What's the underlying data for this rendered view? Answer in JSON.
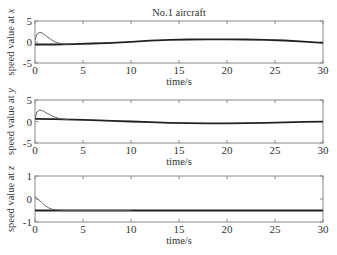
{
  "figure": {
    "title": "No.1 aircraft",
    "colors": {
      "axes": "#8a8a8a",
      "thick_line": "#222222",
      "thin_line": "#555555",
      "text": "#333333"
    }
  },
  "chart_data": [
    {
      "type": "line",
      "title": "No.1 aircraft",
      "xlabel": "time/s",
      "ylabel": "speed value at x",
      "ylabel_var": "x",
      "xlim": [
        0,
        30
      ],
      "ylim": [
        -5,
        5
      ],
      "xticks": [
        0,
        5,
        10,
        15,
        20,
        25,
        30
      ],
      "yticks": [
        -5,
        0,
        5
      ],
      "grid": false,
      "series": [
        {
          "name": "leader/target (thick)",
          "style": "thick",
          "x": [
            0,
            2,
            4,
            6,
            8,
            10,
            12,
            14,
            16,
            18,
            20,
            22,
            24,
            26,
            28,
            30
          ],
          "values": [
            -0.6,
            -0.6,
            -0.5,
            -0.35,
            -0.2,
            0.05,
            0.3,
            0.5,
            0.6,
            0.65,
            0.65,
            0.6,
            0.5,
            0.35,
            0.1,
            -0.2
          ]
        },
        {
          "name": "follower (thin)",
          "style": "thin",
          "x": [
            0,
            0.2,
            0.5,
            0.8,
            1.2,
            1.6,
            2,
            2.5,
            3,
            3.5
          ],
          "values": [
            0.5,
            1.8,
            2.3,
            2.1,
            1.4,
            0.7,
            0.1,
            -0.3,
            -0.5,
            -0.55
          ]
        }
      ]
    },
    {
      "type": "line",
      "xlabel": "time/s",
      "ylabel": "speed value at y",
      "ylabel_var": "y",
      "xlim": [
        0,
        30
      ],
      "ylim": [
        -5,
        5
      ],
      "xticks": [
        0,
        5,
        10,
        15,
        20,
        25,
        30
      ],
      "yticks": [
        -5,
        0,
        5
      ],
      "grid": false,
      "series": [
        {
          "name": "leader/target (thick)",
          "style": "thick",
          "x": [
            0,
            2,
            4,
            6,
            8,
            10,
            12,
            14,
            16,
            18,
            20,
            22,
            24,
            26,
            28,
            30
          ],
          "values": [
            0.6,
            0.55,
            0.45,
            0.3,
            0.15,
            0.0,
            -0.15,
            -0.3,
            -0.4,
            -0.45,
            -0.45,
            -0.4,
            -0.3,
            -0.2,
            -0.1,
            -0.05
          ]
        },
        {
          "name": "follower (thin)",
          "style": "thin",
          "x": [
            0,
            0.2,
            0.5,
            0.8,
            1.2,
            1.6,
            2,
            2.5,
            3,
            3.5
          ],
          "values": [
            0.6,
            2.2,
            2.7,
            2.5,
            2.0,
            1.5,
            1.1,
            0.7,
            0.5,
            0.45
          ]
        }
      ]
    },
    {
      "type": "line",
      "xlabel": "time/s",
      "ylabel": "speed value at z",
      "ylabel_var": "z",
      "xlim": [
        0,
        30
      ],
      "ylim": [
        -1,
        1
      ],
      "xticks": [
        0,
        5,
        10,
        15,
        20,
        25,
        30
      ],
      "yticks": [
        -1,
        0,
        1
      ],
      "grid": false,
      "series": [
        {
          "name": "leader/target (thick)",
          "style": "thick",
          "x": [
            0,
            30
          ],
          "values": [
            -0.5,
            -0.5
          ]
        },
        {
          "name": "follower (thin)",
          "style": "thin",
          "x": [
            0,
            0.3,
            0.7,
            1.0,
            1.4,
            1.8,
            2.2,
            3,
            10
          ],
          "values": [
            0.1,
            0.0,
            -0.15,
            -0.27,
            -0.38,
            -0.45,
            -0.48,
            -0.5,
            -0.5
          ]
        }
      ]
    }
  ]
}
